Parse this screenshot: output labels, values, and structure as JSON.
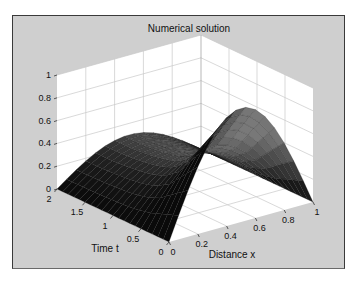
{
  "chart_data": {
    "type": "surface",
    "title": "Numerical solution",
    "xlabel": "Distance x",
    "ylabel": "Time t",
    "zlabel": "",
    "xlim": [
      0,
      1
    ],
    "ylim": [
      0,
      2
    ],
    "zlim": [
      0,
      1
    ],
    "x_ticks": [
      "0",
      "0.2",
      "0.4",
      "0.6",
      "0.8",
      "1"
    ],
    "y_ticks": [
      "0",
      "0.5",
      "1",
      "1.5",
      "2"
    ],
    "z_ticks": [
      "0",
      "0.2",
      "0.4",
      "0.6",
      "0.8",
      "1"
    ],
    "grid": true,
    "colormap": "gray",
    "surface_description": "u(x,t) = sin(pi*x) * f(t); f(0)=1 peak at x=0.5, narrowing to a pinch near t~0.7, small hump (~0.3) at t=2",
    "t_profile": [
      {
        "t": 0.0,
        "amp": 1.0
      },
      {
        "t": 0.25,
        "amp": 0.78
      },
      {
        "t": 0.5,
        "amp": 0.55
      },
      {
        "t": 0.75,
        "amp": 0.42
      },
      {
        "t": 1.0,
        "amp": 0.36
      },
      {
        "t": 1.25,
        "amp": 0.33
      },
      {
        "t": 1.5,
        "amp": 0.31
      },
      {
        "t": 1.75,
        "amp": 0.3
      },
      {
        "t": 2.0,
        "amp": 0.3
      }
    ],
    "mesh": {
      "nx": 15,
      "nt": 20
    }
  },
  "colors": {
    "frame_bg": "#cfcfcf",
    "axes_bg": "#ffffff",
    "grid": "#c8c8c8"
  }
}
